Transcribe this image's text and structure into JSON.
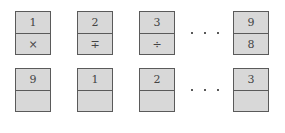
{
  "rows": [
    {
      "cards": [
        {
          "top": "1",
          "bottom": "×"
        },
        {
          "top": "2",
          "bottom": "∓"
        },
        {
          "top": "3",
          "bottom": "÷"
        },
        {
          "top": "9",
          "bottom": "8"
        }
      ],
      "ellipsis": "· · ·"
    },
    {
      "cards": [
        {
          "top": "9",
          "bottom": ""
        },
        {
          "top": "1",
          "bottom": ""
        },
        {
          "top": "2",
          "bottom": ""
        },
        {
          "top": "3",
          "bottom": ""
        }
      ],
      "ellipsis": "· · ·"
    }
  ]
}
